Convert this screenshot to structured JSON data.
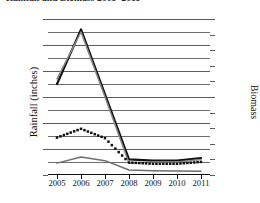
{
  "chart_data": {
    "type": "line",
    "title": "Rainfall and Biomass 2005–2011",
    "xlabel": "",
    "ylabel": "Rainfall (inches)",
    "y2label": "Biomass",
    "categories": [
      "2005",
      "2006",
      "2007",
      "2008",
      "2009",
      "2010",
      "2011"
    ],
    "ylim": [
      0,
      120
    ],
    "yticks": [
      0,
      20,
      40,
      60,
      80,
      100,
      120
    ],
    "y2lim": [
      0,
      500
    ],
    "y2ticks": [
      0,
      50,
      100,
      150,
      200,
      250,
      300,
      350,
      400,
      450,
      500
    ],
    "grid": true,
    "grid_minor_step": 10,
    "legend": "none",
    "series": [
      {
        "name": "Rainfall",
        "axis": "left",
        "style": "solid",
        "color": "#111111",
        "values": [
          70,
          112,
          62,
          12,
          11,
          11,
          13
        ]
      },
      {
        "name": "Rainfall shadow",
        "axis": "left",
        "style": "solid",
        "color": "#8a8a8a",
        "values": [
          74,
          110,
          60,
          9,
          10,
          10,
          12
        ]
      },
      {
        "name": "Biomass",
        "axis": "right",
        "style": "dotted",
        "color": "#111111",
        "values": [
          120,
          148,
          118,
          40,
          36,
          36,
          42
        ]
      },
      {
        "name": "Biomass secondary",
        "axis": "right",
        "style": "solid",
        "color": "#6e6e6e",
        "values": [
          38,
          58,
          46,
          16,
          14,
          13,
          12
        ]
      }
    ]
  }
}
